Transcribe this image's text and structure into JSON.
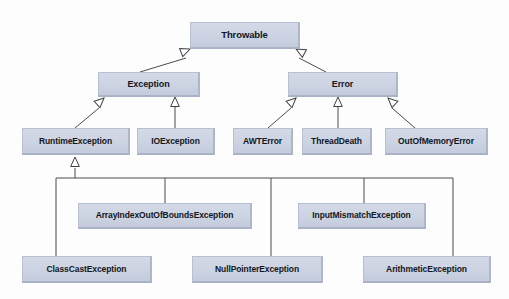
{
  "diagram": {
    "type": "uml-class-hierarchy",
    "canvas": {
      "width": 509,
      "height": 299,
      "background": "#fdfdfe"
    },
    "style": {
      "node_fill": "#ccd3e2",
      "node_border": "#b7bfd2",
      "edge_color": "#4a4a52",
      "text_color": "#13161c"
    },
    "nodes": [
      {
        "id": "throwable",
        "label": "Throwable",
        "x": 190,
        "y": 22,
        "w": 110,
        "h": 27,
        "font": 9.5
      },
      {
        "id": "exception",
        "label": "Exception",
        "x": 98,
        "y": 72,
        "w": 102,
        "h": 25,
        "font": 9
      },
      {
        "id": "error",
        "label": "Error",
        "x": 288,
        "y": 72,
        "w": 110,
        "h": 25,
        "font": 9
      },
      {
        "id": "runtime-exception",
        "label": "RuntimeException",
        "x": 22,
        "y": 128,
        "w": 108,
        "h": 27,
        "font": 8.5
      },
      {
        "id": "io-exception",
        "label": "IOException",
        "x": 137,
        "y": 128,
        "w": 78,
        "h": 27,
        "font": 8.5
      },
      {
        "id": "awt-error",
        "label": "AWTError",
        "x": 233,
        "y": 128,
        "w": 60,
        "h": 27,
        "font": 8.5
      },
      {
        "id": "thread-death",
        "label": "ThreadDeath",
        "x": 302,
        "y": 128,
        "w": 70,
        "h": 27,
        "font": 8.5
      },
      {
        "id": "out-of-memory-error",
        "label": "OutOfMemoryError",
        "x": 385,
        "y": 128,
        "w": 103,
        "h": 27,
        "font": 8.5
      },
      {
        "id": "array-index-out-of-bounds-exception",
        "label": "ArrayIndexOutOfBoundsException",
        "x": 78,
        "y": 203,
        "w": 174,
        "h": 26,
        "font": 8.5
      },
      {
        "id": "input-mismatch-exception",
        "label": "InputMismatchException",
        "x": 298,
        "y": 203,
        "w": 128,
        "h": 26,
        "font": 8.5
      },
      {
        "id": "class-cast-exception",
        "label": "ClassCastException",
        "x": 22,
        "y": 256,
        "w": 130,
        "h": 27,
        "font": 8.5
      },
      {
        "id": "null-pointer-exception",
        "label": "NullPointerException",
        "x": 192,
        "y": 256,
        "w": 131,
        "h": 27,
        "font": 8.5
      },
      {
        "id": "arithmetic-exception",
        "label": "ArithmeticException",
        "x": 363,
        "y": 256,
        "w": 128,
        "h": 27,
        "font": 8.5
      }
    ],
    "edges": [
      {
        "from": "exception",
        "to": "throwable",
        "kind": "generalization",
        "arrow": "hollow-triangle"
      },
      {
        "from": "error",
        "to": "throwable",
        "kind": "generalization",
        "arrow": "hollow-triangle"
      },
      {
        "from": "runtime-exception",
        "to": "exception",
        "kind": "generalization",
        "arrow": "hollow-triangle"
      },
      {
        "from": "io-exception",
        "to": "exception",
        "kind": "generalization",
        "arrow": "hollow-triangle"
      },
      {
        "from": "awt-error",
        "to": "error",
        "kind": "generalization",
        "arrow": "hollow-triangle"
      },
      {
        "from": "thread-death",
        "to": "error",
        "kind": "generalization",
        "arrow": "hollow-triangle"
      },
      {
        "from": "out-of-memory-error",
        "to": "error",
        "kind": "generalization",
        "arrow": "hollow-triangle"
      },
      {
        "from": "class-cast-exception",
        "to": "runtime-exception",
        "kind": "generalization",
        "arrow": "hollow-triangle",
        "routing": "orthogonal-bus"
      },
      {
        "from": "array-index-out-of-bounds-exception",
        "to": "runtime-exception",
        "kind": "generalization",
        "arrow": "hollow-triangle",
        "routing": "orthogonal-bus"
      },
      {
        "from": "null-pointer-exception",
        "to": "runtime-exception",
        "kind": "generalization",
        "arrow": "hollow-triangle",
        "routing": "orthogonal-bus"
      },
      {
        "from": "input-mismatch-exception",
        "to": "runtime-exception",
        "kind": "generalization",
        "arrow": "hollow-triangle",
        "routing": "orthogonal-bus"
      },
      {
        "from": "arithmetic-exception",
        "to": "runtime-exception",
        "kind": "generalization",
        "arrow": "hollow-triangle",
        "routing": "orthogonal-bus"
      }
    ]
  }
}
